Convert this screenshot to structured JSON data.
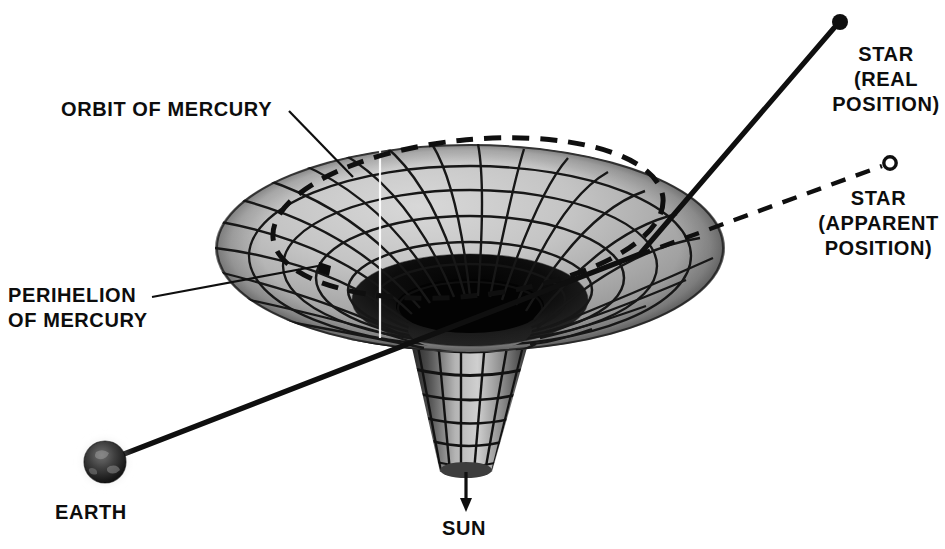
{
  "figure": {
    "background_color": "#ffffff",
    "ink_color": "#0d0d0d",
    "width": 945,
    "height": 549
  },
  "labels": {
    "orbit_of_mercury": "ORBIT OF MERCURY",
    "perihelion_of_mercury": "PERIHELION\nOF MERCURY",
    "earth": "EARTH",
    "sun": "SUN",
    "star_real": "STAR\n(REAL\nPOSITION)",
    "star_apparent": "STAR\n(APPARENT\nPOSITION)"
  },
  "markers": {
    "star_real_dot": {
      "x": 840,
      "y": 22,
      "r": 8,
      "style": "filled",
      "color": "#0d0d0d"
    },
    "star_apparent_dot": {
      "x": 890,
      "y": 163,
      "r": 6.5,
      "style": "hollow",
      "color": "#0d0d0d"
    },
    "earth_sphere": {
      "x": 105,
      "y": 462,
      "r": 21,
      "style": "shaded-globe"
    },
    "perihelion_mark": {
      "x": 325,
      "y": 268,
      "r": 6,
      "style": "filled"
    }
  },
  "rays": {
    "light_ray_solid": {
      "name": "bent light path from Earth to real star",
      "style": "solid",
      "width": 5,
      "points": [
        [
          124,
          454
        ],
        [
          640,
          254
        ],
        [
          834,
          28
        ]
      ]
    },
    "sight_line_dashed": {
      "name": "apparent straight line of sight to star",
      "style": "dashed",
      "width": 4,
      "dash": "14,11",
      "points": [
        [
          640,
          254
        ],
        [
          882,
          166
        ]
      ]
    }
  },
  "leaders": {
    "orbit_leader": {
      "points": [
        [
          289,
          111
        ],
        [
          352,
          176
        ]
      ],
      "width": 2
    },
    "perihelion_leader": {
      "points": [
        [
          152,
          297
        ],
        [
          318,
          265
        ]
      ],
      "width": 2
    },
    "sun_arrow": {
      "points": [
        [
          466,
          470
        ],
        [
          466,
          508
        ]
      ],
      "width": 3,
      "arrow": true
    }
  },
  "funnel": {
    "rim": {
      "cx": 470,
      "cy": 248,
      "rx": 255,
      "ry": 104
    },
    "throat_top": {
      "cx": 470,
      "cy": 330,
      "rx": 62,
      "ry": 22
    },
    "neck_bottom": {
      "cx": 466,
      "cy": 470,
      "rx": 26,
      "ry": 9
    },
    "surface_light": "#c9c9c9",
    "surface_mid": "#a9a9a9",
    "surface_dark": "#3a3a3a",
    "interior_black": "#050505",
    "grid_color": "#141414",
    "radial_spokes": 24,
    "concentric_rings": 6,
    "neck_rings": 7,
    "seam_line_x": 380,
    "seam_color": "#ffffff"
  },
  "mercury_orbit": {
    "name": "dashed elliptical orbit of Mercury on the funnel",
    "style": "dashed",
    "dash": "17,11",
    "width": 5,
    "cx": 468,
    "cy": 218,
    "rx": 196,
    "ry": 78,
    "rotation_deg": -6
  }
}
